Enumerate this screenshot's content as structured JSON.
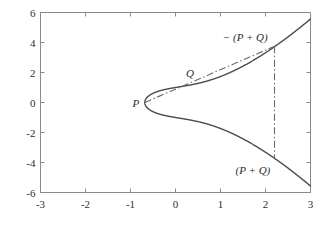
{
  "chart_data": {
    "type": "line",
    "title": "",
    "xlabel": "",
    "ylabel": "",
    "xlim": [
      -3,
      3
    ],
    "ylim": [
      -6,
      6
    ],
    "grid": false,
    "legend": "none",
    "xticks": [
      "-3",
      "-2",
      "-1",
      "0",
      "1",
      "2",
      "3"
    ],
    "xtick_values": [
      -3,
      -2,
      -1,
      0,
      1,
      2,
      3
    ],
    "yticks": [
      "-6",
      "-4",
      "-2",
      "0",
      "2",
      "4",
      "6"
    ],
    "ytick_values": [
      -6,
      -4,
      -2,
      0,
      2,
      4,
      6
    ],
    "curve": {
      "name": "elliptic curve y^2 = x^3 + x + 1",
      "equation": "y^2 = x^3 + x + 1",
      "x_root": -0.6823,
      "x_max": 3,
      "style": "solid",
      "color": "#4a4a4a"
    },
    "chord": {
      "name": "chord through P and Q",
      "style": "dashdot",
      "color": "#6b6b6b",
      "x_start": -0.6823,
      "y_start": 0,
      "x_end": 2.2,
      "y_end": 3.75
    },
    "vertical": {
      "name": "vertical reflection line at x = 2.2",
      "style": "dashdot",
      "color": "#6b6b6b",
      "x": 2.2,
      "y_top": 3.75,
      "y_bottom": -3.75
    },
    "annotations": [
      {
        "key": "P",
        "text": "P",
        "x": -0.6823,
        "y": 0,
        "label_x": -0.88,
        "label_y": 0.0
      },
      {
        "key": "Q",
        "text": "Q",
        "x": 0.4,
        "y": 1.24,
        "label_x": 0.32,
        "label_y": 2.0
      },
      {
        "key": "neg_sum",
        "text": "− (P + Q)",
        "x": 2.2,
        "y": 3.75,
        "label_x": 1.55,
        "label_y": 4.35
      },
      {
        "key": "sum",
        "text": "(P + Q)",
        "x": 2.2,
        "y": -3.75,
        "label_x": 1.72,
        "label_y": -4.5
      }
    ]
  },
  "axes": {
    "frame_color": "#8a8a8a",
    "tick_color": "#8a8a8a",
    "background": "#ffffff"
  }
}
